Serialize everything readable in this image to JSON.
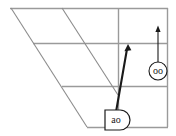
{
  "figure": {
    "type": "geometric-diagram",
    "background_color": "#ffffff",
    "grid_color": "#9a9a9a",
    "diagonal_color": "#8c8c8c",
    "arrow_color": "#1a1a1a",
    "node_stroke_color": "#1a1a1a",
    "node_fill_color": "#ffffff"
  },
  "nodes": [
    {
      "id": "node-ao",
      "label": "ao",
      "shape": "d-shape-rounded-right",
      "x": 118,
      "y": 120
    },
    {
      "id": "node-oo",
      "label": "oo",
      "shape": "circle",
      "x": 158,
      "y": 71
    }
  ],
  "arrows": [
    {
      "id": "arrow-ao",
      "from_node": "node-ao",
      "to_x": 128,
      "to_y": 45,
      "weight": "thick",
      "direction": "up-right"
    },
    {
      "id": "arrow-oo",
      "from_node": "node-oo",
      "to_x": 158,
      "to_y": 26,
      "weight": "thin",
      "direction": "up"
    }
  ],
  "grid": {
    "horizontal_lines_y": [
      8,
      43,
      86,
      127
    ],
    "vertical_lines_x": [
      118,
      168
    ],
    "diagonal_lines": [
      {
        "x1": 11,
        "y1": 8,
        "x2": 87,
        "y2": 127
      },
      {
        "x1": 62,
        "y1": 8,
        "x2": 118,
        "y2": 95
      }
    ]
  },
  "accessibility": {
    "description": "Perspective grid diagram with two labelled nodes and upward arrows"
  }
}
